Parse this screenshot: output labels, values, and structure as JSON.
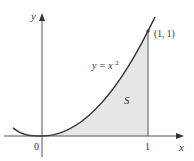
{
  "diagram": {
    "axes": {
      "x_label": "x",
      "y_label": "y",
      "origin_label": "0",
      "x_tick_label": "1"
    },
    "curve": {
      "equation_label_prefix": "y = x",
      "equation_label_exp": "2"
    },
    "point": {
      "label": "(1, 1)"
    },
    "region": {
      "label": "S",
      "fill_color": "#e8e8e8"
    },
    "colors": {
      "curve": "#3a3a3a",
      "axis": "#555555"
    }
  }
}
